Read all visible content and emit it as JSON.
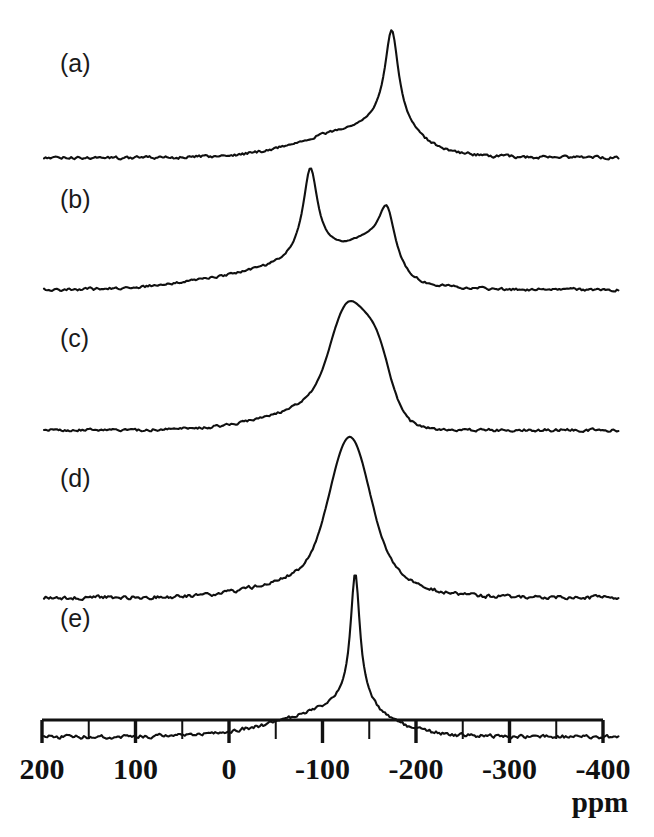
{
  "figure": {
    "background_color": "#ffffff",
    "trace_color": "#101010",
    "axis_color": "#111111"
  },
  "axis": {
    "unit_label": "ppm",
    "tick_labels": [
      "200",
      "100",
      "0",
      "-100",
      "-200",
      "-300",
      "-400"
    ],
    "tick_values": [
      200,
      100,
      0,
      -100,
      -200,
      -300,
      -400
    ],
    "minor_tick_values": [
      150,
      50,
      -50,
      -150,
      -250,
      -350
    ],
    "min_ppm": -400,
    "max_ppm": 200,
    "direction": "decreasing-left-to-right"
  },
  "panels": [
    {
      "label": "(a)"
    },
    {
      "label": "(b)"
    },
    {
      "label": "(c)"
    },
    {
      "label": "(d)"
    },
    {
      "label": "(e)"
    }
  ],
  "chart_data": {
    "type": "line",
    "xlabel": "ppm",
    "ylabel": "",
    "xlim": [
      200,
      -400
    ],
    "x_inverted": true,
    "grid": false,
    "legend": "none",
    "noise_amplitude": 0.018,
    "series": [
      {
        "name": "(a)",
        "label": "(a)",
        "baseline_y": 158,
        "peak_top_y": 30,
        "x_start_px": 44,
        "x_end_px": 620,
        "components": [
          {
            "center_ppm": -174,
            "height": 1.0,
            "width_ppm": 13,
            "shape": "lorentz"
          },
          {
            "center_ppm": -174,
            "height": 0.3,
            "width_ppm": 38,
            "shape": "lorentz"
          },
          {
            "center_ppm": -135,
            "height": 0.21,
            "width_ppm": 75,
            "shape": "gauss"
          },
          {
            "center_ppm": -105,
            "height": 0.07,
            "width_ppm": 95,
            "shape": "gauss"
          }
        ]
      },
      {
        "name": "(b)",
        "label": "(b)",
        "baseline_y": 290,
        "peak_top_y": 168,
        "x_start_px": 44,
        "x_end_px": 620,
        "components": [
          {
            "center_ppm": -87,
            "height": 1.0,
            "width_ppm": 14,
            "shape": "lorentz"
          },
          {
            "center_ppm": -87,
            "height": 0.22,
            "width_ppm": 45,
            "shape": "lorentz"
          },
          {
            "center_ppm": -169,
            "height": 0.7,
            "width_ppm": 17,
            "shape": "lorentz"
          },
          {
            "center_ppm": -152,
            "height": 0.3,
            "width_ppm": 28,
            "shape": "gauss"
          },
          {
            "center_ppm": -120,
            "height": 0.18,
            "width_ppm": 40,
            "shape": "gauss"
          },
          {
            "center_ppm": -60,
            "height": 0.22,
            "width_ppm": 115,
            "shape": "gauss"
          }
        ]
      },
      {
        "name": "(c)",
        "label": "(c)",
        "baseline_y": 430,
        "peak_top_y": 301,
        "x_start_px": 44,
        "x_end_px": 620,
        "components": [
          {
            "center_ppm": -127,
            "height": 1.0,
            "width_ppm": 26,
            "shape": "gauss"
          },
          {
            "center_ppm": -159,
            "height": 0.62,
            "width_ppm": 20,
            "shape": "gauss"
          },
          {
            "center_ppm": -143,
            "height": 0.36,
            "width_ppm": 40,
            "shape": "gauss"
          },
          {
            "center_ppm": -110,
            "height": 0.3,
            "width_ppm": 58,
            "shape": "gauss"
          },
          {
            "center_ppm": -70,
            "height": 0.13,
            "width_ppm": 90,
            "shape": "gauss"
          }
        ]
      },
      {
        "name": "(d)",
        "label": "(d)",
        "baseline_y": 598,
        "peak_top_y": 437,
        "x_start_px": 44,
        "x_end_px": 620,
        "components": [
          {
            "center_ppm": -129,
            "height": 1.0,
            "width_ppm": 30,
            "shape": "gauss"
          },
          {
            "center_ppm": -129,
            "height": 0.22,
            "width_ppm": 62,
            "shape": "lorentz"
          },
          {
            "center_ppm": -100,
            "height": 0.16,
            "width_ppm": 85,
            "shape": "gauss"
          },
          {
            "center_ppm": -155,
            "height": 0.1,
            "width_ppm": 55,
            "shape": "gauss"
          }
        ]
      },
      {
        "name": "(e)",
        "label": "(e)",
        "baseline_y": 737,
        "peak_top_y": 573,
        "x_start_px": 44,
        "x_end_px": 620,
        "components": [
          {
            "center_ppm": -135,
            "height": 1.0,
            "width_ppm": 9,
            "shape": "lorentz"
          },
          {
            "center_ppm": -135,
            "height": 0.17,
            "width_ppm": 30,
            "shape": "lorentz"
          },
          {
            "center_ppm": -118,
            "height": 0.14,
            "width_ppm": 70,
            "shape": "gauss"
          },
          {
            "center_ppm": -80,
            "height": 0.07,
            "width_ppm": 110,
            "shape": "gauss"
          }
        ]
      }
    ]
  },
  "layout": {
    "axis_line_y": 720,
    "axis_left_px": 42,
    "axis_right_px": 603,
    "tick_major_bottom_y": 743,
    "tick_minor_bottom_y": 739,
    "tick_label_y": 779,
    "unit_label_x": 600,
    "unit_label_y": 812,
    "panel_label_x": 60,
    "panel_label_offsets_y": [
      72,
      208,
      347,
      487,
      627
    ]
  }
}
